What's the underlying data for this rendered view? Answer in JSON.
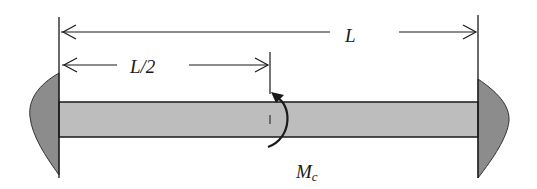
{
  "figure": {
    "type": "fixed-fixed beam with concentrated moment at midspan",
    "labels": {
      "total_length": "L",
      "half_length": "L/2",
      "moment_main": "M",
      "moment_sub": "c"
    },
    "colors": {
      "beam_fill": "#bdbdbd",
      "support_fill": "#8c8c8c",
      "line": "#1a1a1a",
      "background": "#ffffff"
    },
    "elements": [
      {
        "name": "left-fixed-support",
        "description": "curved shaded wall at left end"
      },
      {
        "name": "right-fixed-support",
        "description": "curved shaded wall at right end"
      },
      {
        "name": "beam",
        "description": "horizontal shaded rectangular beam"
      },
      {
        "name": "dimension-L",
        "description": "double-headed arrow spanning full length"
      },
      {
        "name": "dimension-L-half",
        "description": "double-headed arrow from left end to midspan"
      },
      {
        "name": "applied-moment",
        "description": "curved arrow at midspan, counter-clockwise, labeled Mc"
      }
    ]
  }
}
